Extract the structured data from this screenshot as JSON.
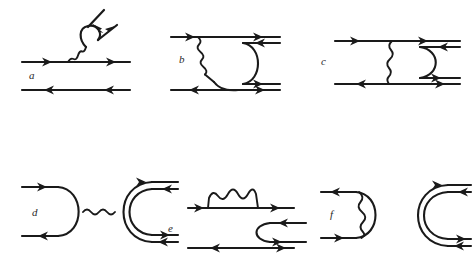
{
  "figure": {
    "background_color": "#ffffff",
    "line_color": "#1a1a1a",
    "label_color": "#2a2a2a",
    "panel_count": 6
  },
  "panels": [
    {
      "id": "a",
      "label": "a",
      "description": "Single fermion line emitting a photon that creates a pair; lower antifermion line",
      "elements": [
        "incoming-fermion-line",
        "photon-wavy-line",
        "pair-creation-loop",
        "outgoing-pair-arrow-left",
        "outgoing-pair-arrow-right",
        "lower-antifermion-line"
      ]
    },
    {
      "id": "b",
      "label": "b",
      "description": "Photon exchange from upper fermion line into a right-side arc joining two double lines",
      "elements": [
        "upper-fermion-line",
        "photon-wavy-line",
        "right-arc",
        "upper-double-line",
        "lower-double-line",
        "lower-antifermion-line"
      ]
    },
    {
      "id": "c",
      "label": "c",
      "description": "Vertical photon exchange between two fermion lines with a right-side arc and double lines",
      "elements": [
        "upper-fermion-line",
        "lower-antifermion-line",
        "vertical-photon-wavy-line",
        "right-arc",
        "upper-double-line",
        "lower-double-line"
      ]
    },
    {
      "id": "d",
      "label": "d",
      "description": "Left closed arc loop connected by a horizontal photon to a right double-line arc",
      "elements": [
        "left-arc-loop",
        "incoming-line-top",
        "outgoing-line-bottom",
        "horizontal-photon-wavy-line",
        "right-double-arc",
        "upper-double-line",
        "lower-double-line"
      ]
    },
    {
      "id": "e",
      "label": "e",
      "description": "Self-energy photon arch on upper fermion line; right-side arc joining double lines",
      "elements": [
        "upper-fermion-line",
        "photon-arch-wavy-line",
        "right-arc",
        "upper-double-line",
        "lower-double-line",
        "lower-antifermion-line"
      ]
    },
    {
      "id": "f",
      "label": "f",
      "description": "Left arc with internal vertical photon; right double-line arc",
      "elements": [
        "left-arc",
        "vertical-photon-wavy-line",
        "incoming-line-bottom",
        "outgoing-line-top",
        "right-double-arc",
        "upper-double-line",
        "lower-double-line"
      ]
    }
  ]
}
